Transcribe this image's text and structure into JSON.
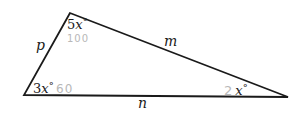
{
  "diagram": {
    "type": "triangle",
    "stroke_color": "#1a1a1a",
    "annotation_color": "#b8b8b8",
    "vertices": {
      "top": {
        "angle_label": "5x°",
        "angle_coef": "5",
        "angle_var": "x",
        "angle_deg": "°",
        "annotation": "100"
      },
      "bottom_left": {
        "angle_label": "3x°",
        "angle_coef": "3",
        "angle_var": "x",
        "angle_deg": "°",
        "annotation": "60"
      },
      "bottom_right": {
        "angle_label": "2x°",
        "angle_coef": "2",
        "angle_var": "x",
        "angle_deg": "°"
      }
    },
    "sides": {
      "left": {
        "label": "p"
      },
      "top_right": {
        "label": "m"
      },
      "bottom": {
        "label": "n"
      }
    }
  }
}
